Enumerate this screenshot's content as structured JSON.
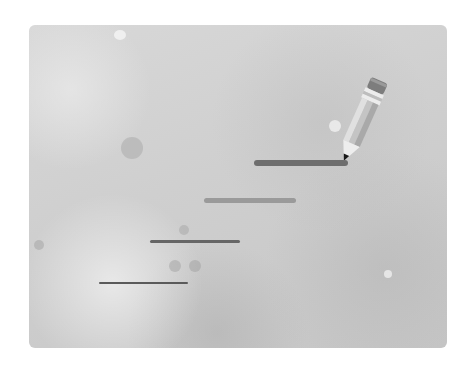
{
  "illustration": {
    "subject": "pencil drawing lines of varying thickness",
    "icon": "pencil-icon",
    "colors": {
      "card_background": "#cfcfcf",
      "stroke_dark": "#6e6e6e",
      "stroke_medium": "#9a9a9a",
      "pencil_tip": "#1a1a1a"
    },
    "strokes": [
      {
        "label": "thick",
        "x1": 254,
        "x2": 348,
        "y": 163,
        "thickness": 6,
        "color": "#6e6e6e"
      },
      {
        "label": "medium-thick",
        "x1": 204,
        "x2": 296,
        "y": 200,
        "thickness": 5,
        "color": "#9a9a9a"
      },
      {
        "label": "medium",
        "x1": 150,
        "x2": 240,
        "y": 241,
        "thickness": 3,
        "color": "#666666"
      },
      {
        "label": "thin",
        "x1": 99,
        "x2": 188,
        "y": 283,
        "thickness": 2,
        "color": "#5a5a5a"
      }
    ]
  }
}
